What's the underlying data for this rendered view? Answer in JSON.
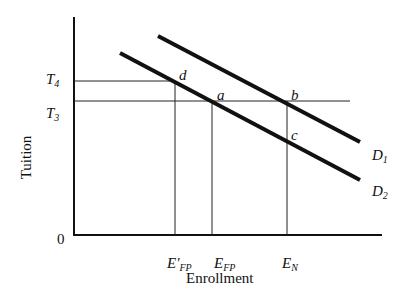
{
  "diagram": {
    "type": "supply-demand style line diagram",
    "axes": {
      "y_label": "Tuition",
      "x_label": "Enrollment",
      "origin_label": "0"
    },
    "y_ticks": [
      {
        "main": "T",
        "sub": "4"
      },
      {
        "main": "T",
        "sub": "3"
      }
    ],
    "x_ticks": [
      {
        "main": "E′",
        "sub": "FP"
      },
      {
        "main": "E",
        "sub": "FP"
      },
      {
        "main": "E",
        "sub": "N"
      }
    ],
    "curves": [
      {
        "main": "D",
        "sub": "1"
      },
      {
        "main": "D",
        "sub": "2"
      }
    ],
    "points": {
      "d": "d",
      "a": "a",
      "b": "b",
      "c": "c"
    },
    "colors": {
      "line": "#111111",
      "background": "#ffffff"
    }
  }
}
